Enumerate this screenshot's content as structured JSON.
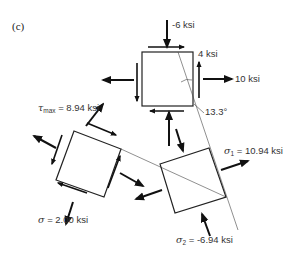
{
  "figure": {
    "panel_label": "(c)",
    "original_element": {
      "normal_y": "-6 ksi",
      "shear": "4 ksi",
      "normal_x": "10 ksi",
      "principal_angle": "13.3°"
    },
    "max_shear_element": {
      "tau_symbol": "τ",
      "tau_subscript": "max",
      "tau_value": " = 8.94 ksi",
      "sigma_symbol": "σ",
      "sigma_value": " = 2.00 ksi"
    },
    "principal_element": {
      "sigma1_symbol": "σ",
      "sigma1_subscript": "1",
      "sigma1_value": " = 10.94 ksi",
      "sigma2_symbol": "σ",
      "sigma2_subscript": "2",
      "sigma2_value": " = -6.94 ksi"
    }
  }
}
